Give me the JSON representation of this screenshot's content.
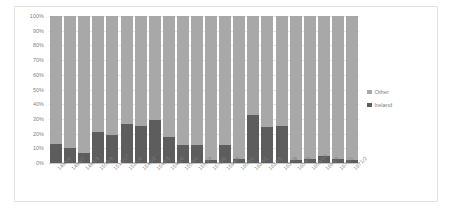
{
  "chart_data": {
    "type": "bar",
    "subtype": "100% stacked bar",
    "title": "",
    "subtitle": "",
    "xlabel": "",
    "ylabel": "",
    "ylim": [
      0,
      100
    ],
    "y_unit": "%",
    "grid": true,
    "legend_position": "right",
    "categories": [
      "1485/6",
      "1486/7",
      "1492/3",
      "1503/4",
      "1516/17",
      "1525/6",
      "1541/2",
      "1542/3",
      "1545/6",
      "1550/1",
      "1563/4",
      "1575/6",
      "1594/5",
      "1600/1",
      "1620/1",
      "1624/5",
      "1637/8",
      "1654/5",
      "1659/60",
      "1664/5",
      "1670/1",
      "1671/2"
    ],
    "y_ticks": [
      "0%",
      "10%",
      "20%",
      "30%",
      "40%",
      "50%",
      "60%",
      "70%",
      "80%",
      "90%",
      "100%"
    ],
    "series": [
      {
        "name": "Ireland",
        "color": "#5d5d5d",
        "values": [
          13,
          10.5,
          7,
          21,
          19,
          26.5,
          25,
          29,
          18,
          12,
          12.5,
          2,
          12,
          3,
          33,
          24.5,
          25.5,
          2,
          3,
          4.5,
          2.5,
          2
        ]
      },
      {
        "name": "Other",
        "color": "#a8a8a8",
        "values": [
          87,
          89.5,
          93,
          79,
          81,
          73.5,
          75,
          71,
          82,
          88,
          87.5,
          98,
          88,
          97,
          67,
          75.5,
          74.5,
          98,
          97,
          95.5,
          97.5,
          98
        ]
      }
    ]
  },
  "legend": {
    "items": [
      {
        "label": "Other",
        "color": "#a8a8a8"
      },
      {
        "label": "Ireland",
        "color": "#5d5d5d"
      }
    ]
  }
}
